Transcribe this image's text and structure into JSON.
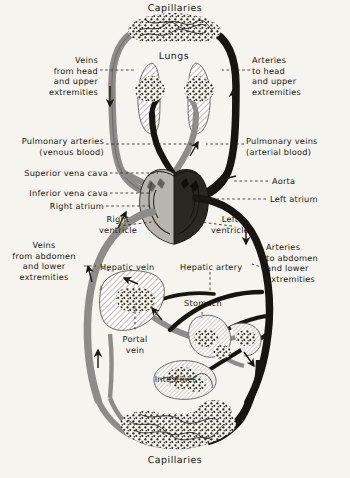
{
  "figure": {
    "background_color": "#f6f4ef",
    "ink_color": "#1a1813",
    "venous_color": "#8e8c88",
    "arterial_color": "#17150f",
    "width": 350,
    "height": 478
  },
  "labels": {
    "capillaries_top": "Capillaries",
    "capillaries_bottom": "Capillaries",
    "lungs": "Lungs",
    "veins_head": "Veins\nfrom head\nand upper\nextremities",
    "arteries_head": "Arteries\nto head\nand upper\nextremities",
    "pulmonary_arteries": "Pulmonary arteries\n(venous blood)",
    "pulmonary_veins": "Pulmonary veins\n(arterial blood)",
    "superior_vena_cava": "Superior vena cava",
    "inferior_vena_cava": "Inferior vena cava",
    "right_atrium": "Right atrium",
    "aorta": "Aorta",
    "left_atrium": "Left atrium",
    "right_ventricle": "Right\nventricle",
    "left_ventricle": "Left\nventricle",
    "veins_abdomen": "Veins\nfrom abdomen\nand lower\nextremities",
    "arteries_abdomen": "Arteries\nto abdomen\nand lower\nextremities",
    "hepatic_vein": "Hepatic vein",
    "hepatic_artery": "Hepatic artery",
    "portal_vein": "Portal\nvein",
    "stomach": "Stomach",
    "intestines": "Intestines"
  },
  "organs": [
    {
      "name": "lungs",
      "label": "Lungs"
    },
    {
      "name": "heart",
      "label": "Heart"
    },
    {
      "name": "liver",
      "label": "Liver"
    },
    {
      "name": "stomach",
      "label": "Stomach"
    },
    {
      "name": "intestines",
      "label": "Intestines"
    }
  ],
  "flow_arrows": [
    {
      "name": "arrow-veins-head-down",
      "direction": "down"
    },
    {
      "name": "arrow-arteries-head-up",
      "direction": "up"
    },
    {
      "name": "arrow-pulmonary-artery-up",
      "direction": "up"
    },
    {
      "name": "arrow-pulmonary-vein-left",
      "direction": "left"
    },
    {
      "name": "arrow-aorta-right",
      "direction": "right"
    },
    {
      "name": "arrow-vena-cava-up",
      "direction": "up"
    },
    {
      "name": "arrow-arteries-abdomen-down",
      "direction": "down"
    },
    {
      "name": "arrow-hepatic-vein-left",
      "direction": "left"
    },
    {
      "name": "arrow-portal-vein-up",
      "direction": "up"
    },
    {
      "name": "arrow-lower-return-up",
      "direction": "up"
    },
    {
      "name": "arrow-lower-supply-down",
      "direction": "down"
    }
  ]
}
